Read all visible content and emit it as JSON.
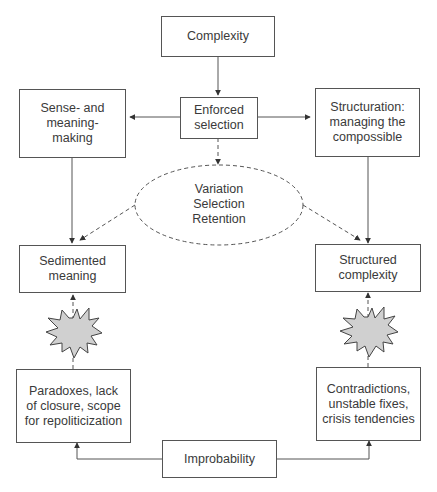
{
  "diagram": {
    "nodes": {
      "complexity": "Complexity",
      "enforced_selection": "Enforced\nselection",
      "sense_meaning": "Sense- and\nmeaning-\nmaking",
      "structuration": "Structuration:\nmanaging the\ncompossible",
      "vsr": "Variation\nSelection\nRetention",
      "sedimented_meaning": "Sedimented\nmeaning",
      "structured_complexity": "Structured\ncomplexity",
      "paradoxes": "Paradoxes, lack\nof closure, scope\nfor repoliticization",
      "contradictions": "Contradictions,\nunstable fixes,\ncrisis tendencies",
      "improbability": "Improbability"
    },
    "colors": {
      "line": "#555555",
      "starburst_fill": "#d0d0d0"
    },
    "edges": [
      {
        "from": "Complexity",
        "to": "Enforced selection",
        "style": "solid"
      },
      {
        "from": "Enforced selection",
        "to": "Sense- and meaning-making",
        "style": "solid"
      },
      {
        "from": "Enforced selection",
        "to": "Structuration",
        "style": "solid"
      },
      {
        "from": "Enforced selection",
        "to": "Variation Selection Retention",
        "style": "dashed"
      },
      {
        "from": "Sense- and meaning-making",
        "to": "Sedimented meaning",
        "style": "solid"
      },
      {
        "from": "Structuration",
        "to": "Structured complexity",
        "style": "solid"
      },
      {
        "from": "Variation Selection Retention",
        "to": "Sedimented meaning",
        "style": "dashed"
      },
      {
        "from": "Variation Selection Retention",
        "to": "Structured complexity",
        "style": "dashed"
      },
      {
        "from": "Paradoxes",
        "to": "Sedimented meaning",
        "style": "dashed"
      },
      {
        "from": "Contradictions",
        "to": "Structured complexity",
        "style": "dashed"
      },
      {
        "from": "Improbability",
        "to": "Paradoxes",
        "style": "solid"
      },
      {
        "from": "Improbability",
        "to": "Contradictions",
        "style": "solid"
      }
    ]
  }
}
